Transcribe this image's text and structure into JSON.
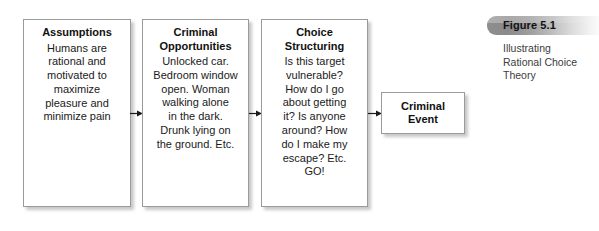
{
  "figure": {
    "number": "Figure 5.1",
    "caption": "Illustrating\nRational Choice\nTheory"
  },
  "diagram": {
    "type": "flowchart",
    "orientation": "left-to-right",
    "boxes": [
      {
        "id": "assumptions",
        "title": "Assumptions",
        "body": "Humans are\nrational and\nmotivated to\nmaximize\npleasure and\nminimize pain"
      },
      {
        "id": "criminal-opportunities",
        "title": "Criminal\nOpportunities",
        "body": "Unlocked car.\nBedroom window\nopen. Woman\nwalking alone\nin the dark.\nDrunk lying on\nthe ground. Etc."
      },
      {
        "id": "choice-structuring",
        "title": "Choice\nStructuring",
        "body": "Is this target\nvulnerable?\nHow do I go\nabout getting\nit? Is anyone\naround? How\ndo I make my\nescape? Etc.\nGO!"
      },
      {
        "id": "criminal-event",
        "title": "Criminal\nEvent",
        "body": ""
      }
    ],
    "connectors": [
      {
        "id": "arrow-1",
        "from": "assumptions",
        "to": "criminal-opportunities",
        "glyph": "arrow-right-icon"
      },
      {
        "id": "arrow-2",
        "from": "criminal-opportunities",
        "to": "choice-structuring",
        "glyph": "arrow-right-icon"
      },
      {
        "id": "arrow-3",
        "from": "choice-structuring",
        "to": "criminal-event",
        "glyph": "arrow-right-icon"
      }
    ]
  },
  "colors": {
    "background": "#ffffff",
    "box_border": "#9a9a9a",
    "box_fill": "#ffffff",
    "text": "#1a1a1a",
    "caption_bar_dark": "#8a8a8a",
    "caption_bar_light": "#fbfbfb",
    "caption_text": "#3c3c3c"
  }
}
